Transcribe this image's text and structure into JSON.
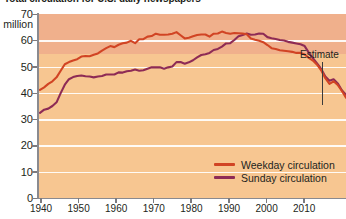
{
  "title": "Total circulation for U.S. daily newspapers",
  "axis": {
    "y_unit": "million",
    "y_ticks": [
      "70",
      "60",
      "50",
      "40",
      "30",
      "20",
      "10",
      "0"
    ],
    "x_ticks": [
      "1940",
      "1950",
      "1960",
      "1970",
      "1980",
      "1990",
      "2000",
      "2010"
    ]
  },
  "annotation": {
    "estimate_label": "Estimate"
  },
  "legend": {
    "items": [
      {
        "label": "Weekday circulation",
        "color": "#d14424"
      },
      {
        "label": "Sunday circulation",
        "color": "#8e2b55"
      }
    ]
  },
  "colors": {
    "band_top": "#f0b08c",
    "band_bottom": "#f7c691",
    "gridline": "#ffffff",
    "axis": "#8a8a8f",
    "weekday": "#d14424",
    "sunday": "#8e2b55",
    "text": "#231f20"
  },
  "chart_data": {
    "type": "line",
    "title": "Total circulation for U.S. daily newspapers",
    "xlabel": "",
    "ylabel": "million",
    "xlim": [
      1940,
      2014
    ],
    "ylim": [
      0,
      70
    ],
    "grid": true,
    "legend_position": "bottom-right",
    "x": [
      1940,
      1941,
      1942,
      1943,
      1944,
      1945,
      1946,
      1947,
      1948,
      1949,
      1950,
      1951,
      1952,
      1953,
      1954,
      1955,
      1956,
      1957,
      1958,
      1959,
      1960,
      1961,
      1962,
      1963,
      1964,
      1965,
      1966,
      1967,
      1968,
      1969,
      1970,
      1971,
      1972,
      1973,
      1974,
      1975,
      1976,
      1977,
      1978,
      1979,
      1980,
      1981,
      1982,
      1983,
      1984,
      1985,
      1986,
      1987,
      1988,
      1989,
      1990,
      1991,
      1992,
      1993,
      1994,
      1995,
      1996,
      1997,
      1998,
      1999,
      2000,
      2001,
      2002,
      2003,
      2004,
      2005,
      2006,
      2007,
      2008,
      2009,
      2010,
      2011,
      2012,
      2013,
      2014
    ],
    "series": [
      {
        "name": "Weekday circulation",
        "color": "#d14424",
        "values": [
          41.1,
          42.1,
          43.4,
          44.4,
          45.9,
          48.4,
          50.9,
          51.7,
          52.3,
          52.8,
          53.8,
          54.0,
          53.9,
          54.5,
          55.0,
          56.1,
          57.0,
          57.8,
          57.4,
          58.3,
          58.9,
          59.1,
          59.8,
          58.9,
          60.4,
          60.4,
          61.4,
          61.6,
          62.5,
          62.1,
          62.1,
          62.2,
          62.5,
          63.1,
          61.9,
          60.7,
          61.0,
          61.5,
          62.0,
          62.2,
          62.2,
          61.4,
          62.5,
          62.6,
          63.3,
          62.8,
          62.5,
          62.8,
          62.7,
          62.6,
          62.3,
          60.7,
          60.2,
          59.8,
          59.3,
          58.2,
          57.0,
          56.7,
          56.2,
          56.0,
          55.8,
          55.6,
          55.2,
          55.2,
          54.6,
          53.3,
          52.3,
          50.7,
          48.6,
          45.6,
          43.4,
          44.4,
          43.0,
          40.7,
          38.2
        ]
      },
      {
        "name": "Sunday circulation",
        "color": "#8e2b55",
        "values": [
          32.4,
          33.6,
          34.0,
          35.0,
          36.4,
          39.9,
          43.1,
          45.2,
          46.0,
          46.4,
          46.6,
          46.3,
          46.2,
          45.9,
          46.2,
          46.4,
          47.0,
          47.0,
          47.0,
          47.8,
          47.7,
          48.2,
          48.4,
          48.9,
          48.4,
          48.6,
          49.2,
          49.7,
          49.7,
          49.7,
          49.2,
          49.7,
          50.0,
          51.7,
          51.7,
          51.1,
          51.6,
          52.4,
          53.5,
          54.4,
          54.7,
          55.2,
          56.3,
          56.7,
          57.6,
          58.8,
          58.9,
          60.1,
          61.5,
          62.0,
          62.6,
          62.1,
          62.2,
          62.6,
          62.5,
          61.2,
          60.8,
          60.5,
          60.1,
          59.9,
          59.4,
          59.1,
          58.8,
          58.5,
          57.8,
          55.3,
          53.2,
          51.2,
          49.1,
          46.2,
          44.6,
          45.2,
          43.6,
          41.0,
          39.3
        ]
      }
    ],
    "annotations": [
      {
        "text": "Estimate",
        "x": 2013,
        "note": "marks estimated final data points"
      }
    ]
  }
}
